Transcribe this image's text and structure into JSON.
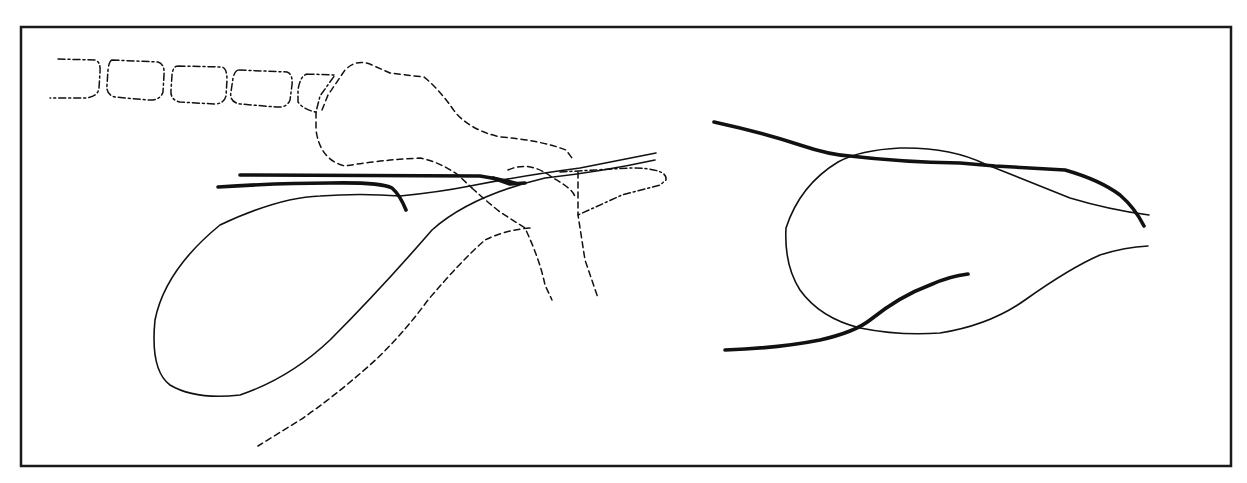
{
  "figure": {
    "background": "#ffffff",
    "line_color": "#111111",
    "frame": {
      "x": 21,
      "y": 27,
      "width": 1210,
      "height": 439
    },
    "panels": [
      {
        "id": "left",
        "description": "loop-shaped solid outline with bold strokes and dashed segmented structures above"
      },
      {
        "id": "right",
        "description": "teardrop-shaped thin outline crossed by two bold strokes"
      }
    ],
    "labels": []
  }
}
